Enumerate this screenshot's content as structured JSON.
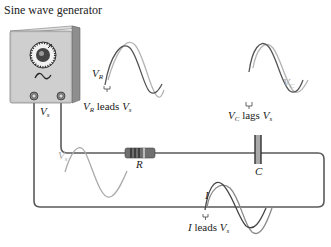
{
  "title": "Sine wave generator",
  "labels": {
    "vs_source": {
      "main": "V",
      "sub": "s"
    },
    "vr_wave": {
      "main": "V",
      "sub": "R"
    },
    "vr_leads": {
      "pre_main": "V",
      "pre_sub": "R",
      "text": " leads ",
      "post_main": "V",
      "post_sub": "s"
    },
    "vc_wave": {
      "main": "V",
      "sub": "C"
    },
    "vc_lags": {
      "pre_main": "V",
      "pre_sub": "C",
      "text": " lags ",
      "post_main": "V",
      "post_sub": "s"
    },
    "resistor": "R",
    "capacitor": "C",
    "vs_wave": {
      "main": "V",
      "sub": "s"
    },
    "i_wave": "I",
    "i_leads": {
      "pre_main": "I",
      "text": " leads ",
      "post_main": "V",
      "post_sub": "s"
    }
  },
  "colors": {
    "wire": "#5a5a5a",
    "dark_wave": "#555555",
    "light_wave": "#b4b4b4",
    "generator_face": "#c9c9c9",
    "generator_side": "#8e8e8e",
    "resistor_body": "#6f6f6f",
    "capacitor_fill": "#a9a9a9"
  },
  "components": [
    "Sine wave generator",
    "Resistor R",
    "Capacitor C"
  ]
}
